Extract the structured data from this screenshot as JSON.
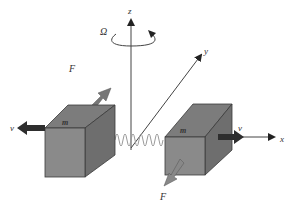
{
  "diagram": {
    "labels": {
      "z_axis": "z",
      "y_axis": "y",
      "x_axis": "x",
      "omega": "Ω",
      "force_left": "F",
      "force_right": "F",
      "velocity_left": "v",
      "velocity_right": "v",
      "mass_left": "m",
      "mass_right": "m"
    },
    "colors": {
      "box_front": "#8a8a8a",
      "box_top": "#7c7c7c",
      "box_side": "#6e6e6e",
      "box_edge": "#3a3a3a",
      "velocity_arrow": "#2e2e2e",
      "force_arrow": "#777777",
      "spring": "#9a9a9a",
      "axis": "#333333"
    },
    "components": [
      {
        "name": "mass-left",
        "description": "cube of mass m moving with velocity v to the left, force F pointing up-right"
      },
      {
        "name": "spring",
        "description": "spring connecting the two masses"
      },
      {
        "name": "mass-right",
        "description": "cube of mass m moving with velocity v to the right, force F pointing down-left"
      },
      {
        "name": "rotation",
        "description": "rotation Ω about z axis"
      }
    ]
  }
}
